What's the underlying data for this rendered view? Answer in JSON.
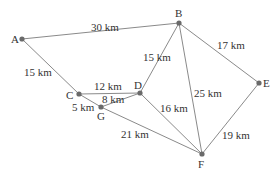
{
  "diagram": {
    "type": "weighted-graph",
    "unit": "km",
    "colors": {
      "edge": "#8a8a8a",
      "node": "#6a6a6a",
      "text": "#333333",
      "background": "#ffffff"
    },
    "nodes": [
      {
        "id": "A",
        "label": "A",
        "x": 22,
        "y": 39,
        "lx": 11,
        "ly": 43
      },
      {
        "id": "B",
        "label": "B",
        "x": 179,
        "y": 23,
        "lx": 175,
        "ly": 17
      },
      {
        "id": "C",
        "label": "C",
        "x": 79,
        "y": 94,
        "lx": 66,
        "ly": 99
      },
      {
        "id": "D",
        "label": "D",
        "x": 140,
        "y": 93,
        "lx": 134,
        "ly": 89
      },
      {
        "id": "G",
        "label": "G",
        "x": 101,
        "y": 107,
        "lx": 97,
        "ly": 120
      },
      {
        "id": "E",
        "label": "E",
        "x": 259,
        "y": 83,
        "lx": 263,
        "ly": 87
      },
      {
        "id": "F",
        "label": "F",
        "x": 202,
        "y": 154,
        "lx": 198,
        "ly": 168
      }
    ],
    "edges": [
      {
        "from": "A",
        "to": "B",
        "weight": "30 km",
        "lx": 91,
        "ly": 31
      },
      {
        "from": "A",
        "to": "C",
        "weight": "15 km",
        "lx": 24,
        "ly": 76
      },
      {
        "from": "B",
        "to": "D",
        "weight": "15 km",
        "lx": 143,
        "ly": 61
      },
      {
        "from": "B",
        "to": "E",
        "weight": "17 km",
        "lx": 217,
        "ly": 49
      },
      {
        "from": "B",
        "to": "F",
        "weight": "25 km",
        "lx": 194,
        "ly": 97
      },
      {
        "from": "C",
        "to": "D",
        "weight": "12 km",
        "lx": 94,
        "ly": 90
      },
      {
        "from": "C",
        "to": "G",
        "weight": "5 km",
        "lx": 72,
        "ly": 111
      },
      {
        "from": "G",
        "to": "D",
        "weight": "8 km",
        "lx": 102,
        "ly": 103
      },
      {
        "from": "D",
        "to": "F",
        "weight": "16 km",
        "lx": 160,
        "ly": 112
      },
      {
        "from": "G",
        "to": "F",
        "weight": "21 km",
        "lx": 121,
        "ly": 138
      },
      {
        "from": "E",
        "to": "F",
        "weight": "19 km",
        "lx": 222,
        "ly": 139
      }
    ]
  }
}
